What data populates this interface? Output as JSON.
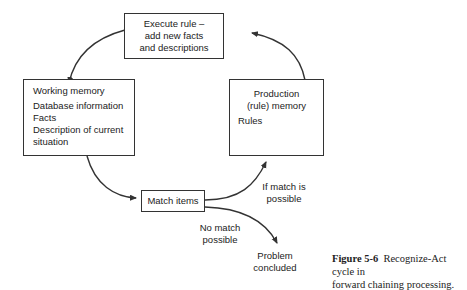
{
  "diagram": {
    "nodes": {
      "execute_rule": {
        "lines": [
          "Execute rule –",
          "add new facts",
          "and descriptions"
        ]
      },
      "working_memory": {
        "title": "Working memory",
        "items": [
          "Database information",
          "Facts",
          "Description of current",
          "situation"
        ]
      },
      "production_memory": {
        "title_lines": [
          "Production",
          "(rule) memory"
        ],
        "items": [
          "Rules"
        ]
      },
      "match_items": {
        "label": "Match items"
      },
      "problem_concluded": {
        "lines": [
          "Problem",
          "concluded"
        ]
      }
    },
    "edge_labels": {
      "if_match": [
        "If match is",
        "possible"
      ],
      "no_match": [
        "No match",
        "possible"
      ]
    },
    "edges": [
      {
        "from": "execute_rule",
        "to": "working_memory"
      },
      {
        "from": "working_memory",
        "to": "match_items"
      },
      {
        "from": "match_items",
        "to": "production_memory",
        "label": "If match is possible"
      },
      {
        "from": "production_memory",
        "to": "execute_rule"
      },
      {
        "from": "match_items",
        "to": "problem_concluded",
        "label": "No match possible"
      }
    ],
    "colors": {
      "stroke": "#333333",
      "text": "#222222",
      "background": "#ffffff"
    }
  },
  "caption": {
    "figure_number": "Figure 5-6",
    "line1": "Recognize-Act cycle in",
    "line2": "forward chaining processing."
  }
}
